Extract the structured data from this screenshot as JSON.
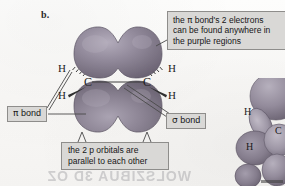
{
  "figure": {
    "panel_letter": "b."
  },
  "callouts": {
    "electrons": {
      "line1_pre": "the ",
      "line1_symbol": "π",
      "line1_post": " bond's 2 electrons",
      "line2": "can be found anywhere in",
      "line3": "the purple regions"
    },
    "parallel": {
      "line1": "the 2 p orbitals are",
      "line2": "parallel to each other"
    },
    "pi_bond": {
      "symbol": "π",
      "label": " bond"
    },
    "sigma_bond": {
      "symbol": "σ",
      "label": " bond"
    }
  },
  "atoms": {
    "carbon_left": "C",
    "carbon_right": "C",
    "h_upper_left": "H",
    "h_lower_left": "H",
    "h_upper_right": "H",
    "h_lower_right": "H"
  },
  "right_figure": {
    "h_upper": "H",
    "h_lower": "H",
    "carbon": "C"
  },
  "artifact": {
    "bleed_text": "WOLSZIBUA 3D OZ"
  },
  "colors": {
    "background": "#fbfaf8",
    "lobe_fill": "#8e8796",
    "lobe_shadow": "#6d6575",
    "lobe_highlight": "#b4aebc",
    "callout_fill": "#d9d8d6",
    "callout_border": "#8e8d8b",
    "line": "#4a4a4a",
    "text": "#161616"
  }
}
